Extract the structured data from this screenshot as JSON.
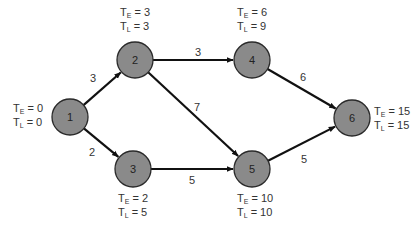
{
  "diagram": {
    "type": "network-critical-path",
    "colors": {
      "node_fill": "#8a8a8a",
      "node_stroke": "#2a2a2a",
      "edge": "#111111",
      "text": "#333333"
    },
    "node_radius": 18,
    "nodes": [
      {
        "id": "1",
        "label": "1",
        "x": 70,
        "y": 117,
        "te": "0",
        "tl": "0",
        "te_label": "T",
        "te_sub": "E",
        "tl_sub": "L",
        "te_text": "= 0",
        "tl_text": "= 0",
        "label_pos": "left"
      },
      {
        "id": "2",
        "label": "2",
        "x": 135,
        "y": 60,
        "te": "3",
        "tl": "3",
        "te_sub": "E",
        "tl_sub": "L",
        "te_text": "= 3",
        "tl_text": "= 3",
        "label_pos": "above"
      },
      {
        "id": "3",
        "label": "3",
        "x": 133,
        "y": 169,
        "te": "2",
        "tl": "5",
        "te_sub": "E",
        "tl_sub": "L",
        "te_text": "= 2",
        "tl_text": "= 5",
        "label_pos": "below"
      },
      {
        "id": "4",
        "label": "4",
        "x": 252,
        "y": 60,
        "te": "6",
        "tl": "9",
        "te_sub": "E",
        "tl_sub": "L",
        "te_text": "= 6",
        "tl_text": "= 9",
        "label_pos": "above"
      },
      {
        "id": "5",
        "label": "5",
        "x": 252,
        "y": 169,
        "te": "10",
        "tl": "10",
        "te_sub": "E",
        "tl_sub": "L",
        "te_text": "= 10",
        "tl_text": "= 10",
        "label_pos": "below"
      },
      {
        "id": "6",
        "label": "6",
        "x": 352,
        "y": 118,
        "te": "15",
        "tl": "15",
        "te_sub": "E",
        "tl_sub": "L",
        "te_text": "= 15",
        "tl_text": "= 15",
        "label_pos": "right"
      }
    ],
    "edges": [
      {
        "from": "1",
        "to": "2",
        "weight": "3",
        "label_x": 93,
        "label_y": 78
      },
      {
        "from": "1",
        "to": "3",
        "weight": "2",
        "label_x": 92,
        "label_y": 152
      },
      {
        "from": "2",
        "to": "4",
        "weight": "3",
        "label_x": 198,
        "label_y": 52
      },
      {
        "from": "2",
        "to": "5",
        "weight": "7",
        "label_x": 197,
        "label_y": 107
      },
      {
        "from": "3",
        "to": "5",
        "weight": "5",
        "label_x": 192,
        "label_y": 180
      },
      {
        "from": "4",
        "to": "6",
        "weight": "6",
        "label_x": 303,
        "label_y": 77
      },
      {
        "from": "5",
        "to": "6",
        "weight": "5",
        "label_x": 304,
        "label_y": 159
      }
    ]
  }
}
